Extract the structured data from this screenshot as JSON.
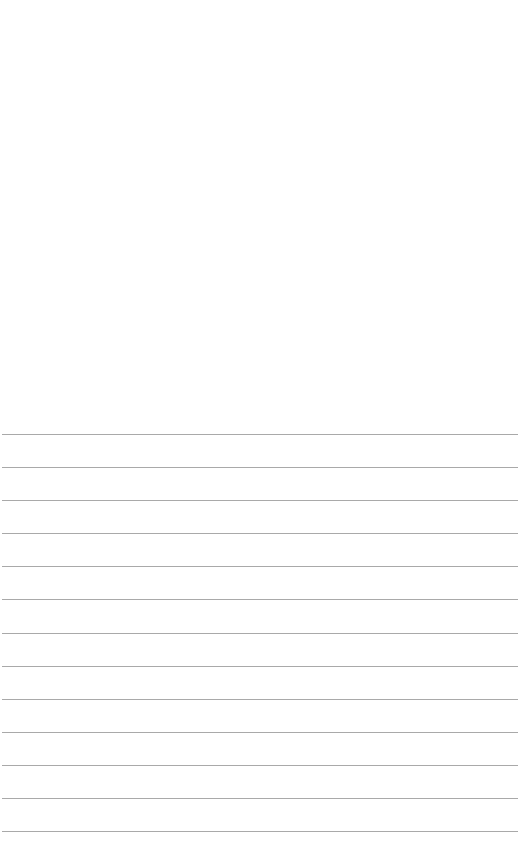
{
  "page": {
    "background_color": "#ffffff",
    "line_color": "#9a9a9a",
    "ruled_lines": {
      "count": 13,
      "positions_y": [
        434,
        467,
        500,
        533,
        566,
        599,
        633,
        666,
        699,
        732,
        765,
        798,
        831
      ],
      "x_start": 2,
      "x_end": 518
    }
  }
}
